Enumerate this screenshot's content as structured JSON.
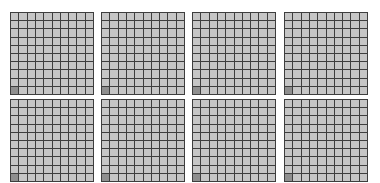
{
  "layout": {
    "rows": 2,
    "cols": 4,
    "grid_size": 10
  },
  "colors": {
    "cell": "#c6c6c6",
    "marked_cell": "#8f8f8f",
    "grid_line": "#3e3e3e",
    "background": "#ffffff"
  },
  "boards": [
    {
      "id": 1,
      "x": 10,
      "y": 12,
      "marked": [
        [
          9,
          0
        ]
      ]
    },
    {
      "id": 2,
      "x": 101,
      "y": 12,
      "marked": [
        [
          9,
          0
        ]
      ]
    },
    {
      "id": 3,
      "x": 192,
      "y": 12,
      "marked": [
        [
          9,
          0
        ]
      ]
    },
    {
      "id": 4,
      "x": 284,
      "y": 12,
      "marked": [
        [
          9,
          0
        ]
      ]
    },
    {
      "id": 5,
      "x": 10,
      "y": 99,
      "marked": [
        [
          9,
          0
        ]
      ]
    },
    {
      "id": 6,
      "x": 101,
      "y": 99,
      "marked": [
        [
          9,
          0
        ]
      ]
    },
    {
      "id": 7,
      "x": 192,
      "y": 99,
      "marked": [
        [
          9,
          0
        ]
      ]
    },
    {
      "id": 8,
      "x": 284,
      "y": 99,
      "marked": [
        [
          9,
          0
        ]
      ]
    }
  ]
}
